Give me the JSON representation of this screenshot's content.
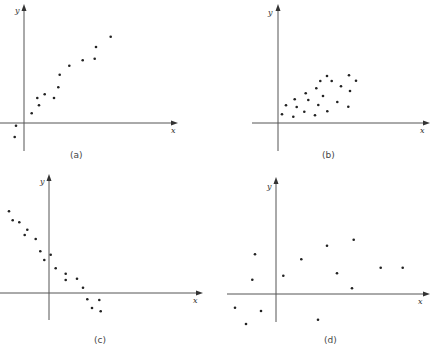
{
  "figure": {
    "panels": [
      {
        "id": "a",
        "label": "(a)",
        "xlabel": "x",
        "ylabel": "y"
      },
      {
        "id": "b",
        "label": "(b)",
        "xlabel": "x",
        "ylabel": "y"
      },
      {
        "id": "c",
        "label": "(c)",
        "xlabel": "x",
        "ylabel": "y"
      },
      {
        "id": "d",
        "label": "(d)",
        "xlabel": "x",
        "ylabel": "y"
      }
    ]
  },
  "chart_data": [
    {
      "type": "scatter",
      "title": "(a)",
      "xlabel": "x",
      "ylabel": "y",
      "description": "strong positive (slightly curved) relationship",
      "grid": false,
      "units": "pixel offsets from axis origin (y up)",
      "points": [
        [
          -8,
          -2.7
        ],
        [
          -9.3,
          -14
        ],
        [
          7.7,
          9.7
        ],
        [
          15,
          17.7
        ],
        [
          13.3,
          25
        ],
        [
          30,
          25
        ],
        [
          20.7,
          28.7
        ],
        [
          34.3,
          35.7
        ],
        [
          35.7,
          48.3
        ],
        [
          45.3,
          57.3
        ],
        [
          58.7,
          62.7
        ],
        [
          70.7,
          64.3
        ],
        [
          72,
          76
        ],
        [
          86.7,
          86.3
        ]
      ]
    },
    {
      "type": "scatter",
      "title": "(b)",
      "xlabel": "x",
      "ylabel": "y",
      "description": "weak positive relationship, wide scatter",
      "grid": false,
      "units": "pixel offsets from axis origin (y up)",
      "points": [
        [
          4,
          8.7
        ],
        [
          8,
          17.7
        ],
        [
          15.3,
          6.3
        ],
        [
          16.7,
          23.7
        ],
        [
          18.7,
          16
        ],
        [
          26.3,
          11.3
        ],
        [
          27.7,
          29.7
        ],
        [
          30.3,
          23
        ],
        [
          37,
          7.7
        ],
        [
          38.3,
          34.7
        ],
        [
          40.3,
          18
        ],
        [
          42.3,
          42
        ],
        [
          45,
          27
        ],
        [
          49,
          47
        ],
        [
          49.3,
          11.7
        ],
        [
          53.7,
          42
        ],
        [
          59.3,
          21
        ],
        [
          63,
          36.7
        ],
        [
          70.3,
          16.3
        ],
        [
          71,
          47.7
        ],
        [
          72,
          32
        ],
        [
          78,
          42.3
        ]
      ]
    },
    {
      "type": "scatter",
      "title": "(c)",
      "xlabel": "x",
      "ylabel": "y",
      "description": "strong negative relationship",
      "grid": false,
      "units": "pixel offsets from axis origin (y up)",
      "points": [
        [
          -40,
          81.7
        ],
        [
          -36.3,
          72.7
        ],
        [
          -29.7,
          70.7
        ],
        [
          -21.7,
          63.3
        ],
        [
          -24.3,
          58
        ],
        [
          -13.3,
          54
        ],
        [
          -8.7,
          41.7
        ],
        [
          1.7,
          38.3
        ],
        [
          -4.7,
          33
        ],
        [
          6.7,
          24.7
        ],
        [
          16.7,
          19.3
        ],
        [
          16.7,
          13
        ],
        [
          28,
          14.3
        ],
        [
          34,
          5.3
        ],
        [
          38.3,
          -6.3
        ],
        [
          50.3,
          -7
        ],
        [
          43,
          -15
        ],
        [
          51.7,
          -18.3
        ]
      ]
    },
    {
      "type": "scatter",
      "title": "(d)",
      "xlabel": "x",
      "ylabel": "y",
      "description": "no apparent relationship",
      "grid": false,
      "units": "pixel offsets from axis origin (y up)",
      "points": [
        [
          -21,
          39.7
        ],
        [
          -23.7,
          14.3
        ],
        [
          -41,
          -13.7
        ],
        [
          -30,
          -30
        ],
        [
          -15,
          -17
        ],
        [
          7.3,
          18.3
        ],
        [
          25.3,
          34.7
        ],
        [
          51,
          48.3
        ],
        [
          61,
          20.7
        ],
        [
          42,
          -25.7
        ],
        [
          77.7,
          54.3
        ],
        [
          76,
          5.7
        ],
        [
          104.7,
          26.3
        ],
        [
          126.7,
          26.3
        ]
      ]
    }
  ]
}
